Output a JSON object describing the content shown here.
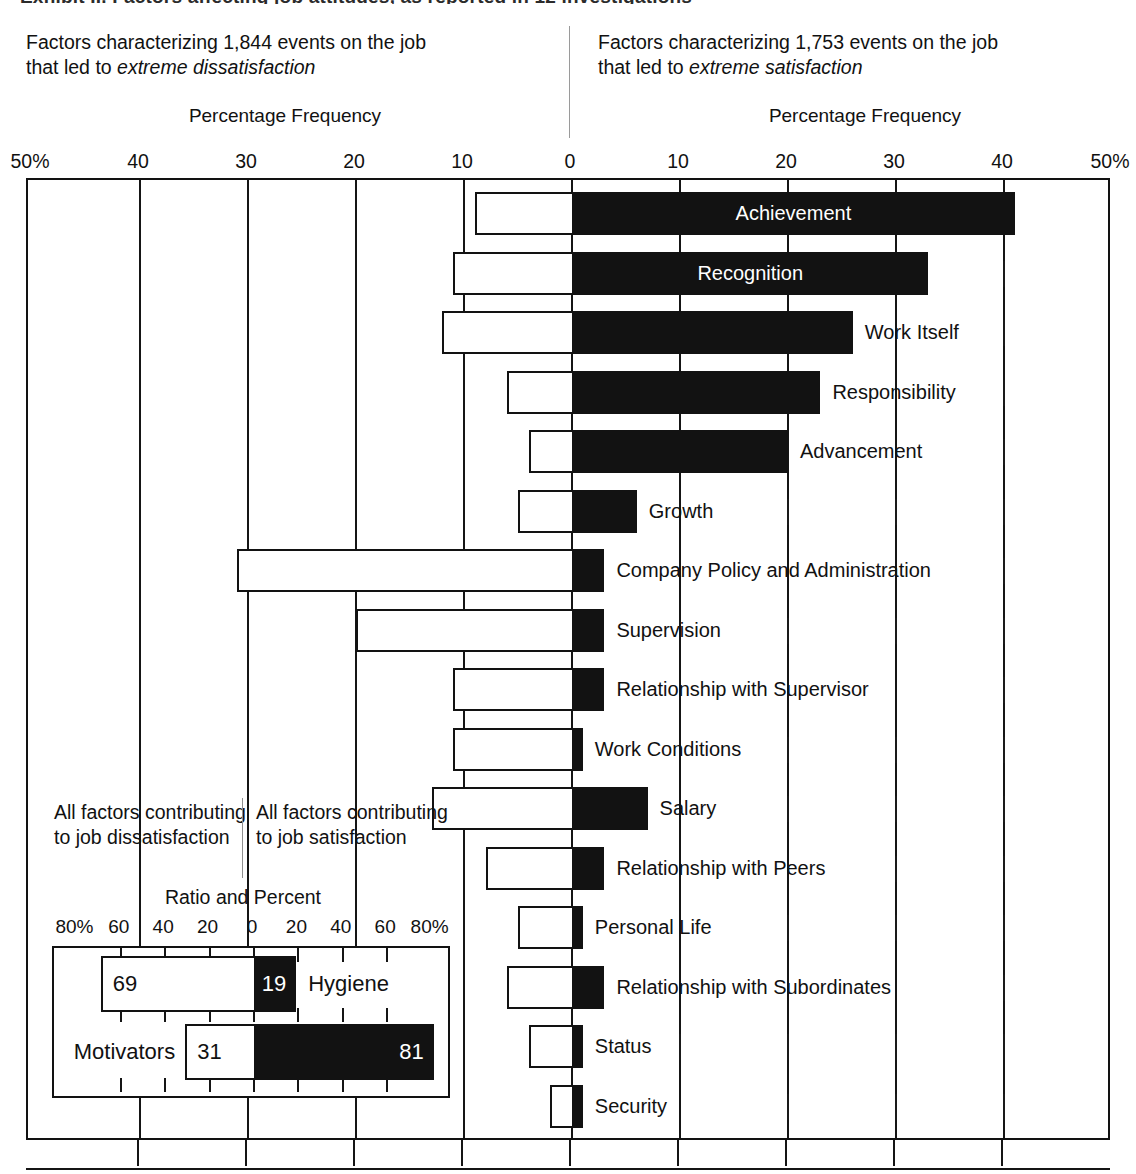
{
  "title_sliver": "Exhibit II. Factors affecting job attitudes, as reported in 12 investigations",
  "captions": {
    "left_pre": "Factors characterizing 1,844 events on the job that led to ",
    "left_em": "extreme dissatisfaction",
    "right_pre": "Factors characterizing 1,753 events on the job that led to ",
    "right_em": "extreme satisfaction",
    "axis_title_left": "Percentage Frequency",
    "axis_title_right": "Percentage Frequency"
  },
  "axis": {
    "ticks": [
      "50%",
      "40",
      "30",
      "20",
      "10",
      "0",
      "10",
      "20",
      "30",
      "40",
      "50%"
    ],
    "tick_values": [
      -50,
      -40,
      -30,
      -20,
      -10,
      0,
      10,
      20,
      30,
      40,
      50
    ],
    "min": -50,
    "max": 50
  },
  "legend": {
    "black_meaning": "extreme satisfaction (motivators)",
    "white_meaning": "extreme dissatisfaction (hygiene)"
  },
  "chart_data": {
    "type": "bar",
    "title": "Factors affecting job attitudes",
    "xlabel": "Percentage Frequency",
    "ylabel": "",
    "xlim": [
      -50,
      50
    ],
    "grid": true,
    "legend_position": "none",
    "orientation": "horizontal-diverging",
    "categories": [
      "Achievement",
      "Recognition",
      "Work Itself",
      "Responsibility",
      "Advancement",
      "Growth",
      "Company Policy and Administration",
      "Supervision",
      "Relationship with Supervisor",
      "Work Conditions",
      "Salary",
      "Relationship with Peers",
      "Personal Life",
      "Relationship with Subordinates",
      "Status",
      "Security"
    ],
    "series": [
      {
        "name": "Factors leading to extreme satisfaction",
        "color": "#121212",
        "values": [
          41,
          33,
          26,
          23,
          20,
          6,
          3,
          3,
          3,
          1,
          7,
          3,
          1,
          3,
          1,
          1
        ]
      },
      {
        "name": "Factors leading to extreme dissatisfaction",
        "color": "#ffffff",
        "values": [
          9,
          11,
          12,
          6,
          4,
          5,
          31,
          20,
          11,
          11,
          13,
          8,
          5,
          6,
          4,
          2
        ]
      }
    ],
    "rows": [
      {
        "label": "Achievement",
        "satisfaction": 41,
        "dissatisfaction": 9,
        "label_position": "inside"
      },
      {
        "label": "Recognition",
        "satisfaction": 33,
        "dissatisfaction": 11,
        "label_position": "inside"
      },
      {
        "label": "Work Itself",
        "satisfaction": 26,
        "dissatisfaction": 12,
        "label_position": "outside"
      },
      {
        "label": "Responsibility",
        "satisfaction": 23,
        "dissatisfaction": 6,
        "label_position": "outside"
      },
      {
        "label": "Advancement",
        "satisfaction": 20,
        "dissatisfaction": 4,
        "label_position": "outside"
      },
      {
        "label": "Growth",
        "satisfaction": 6,
        "dissatisfaction": 5,
        "label_position": "outside"
      },
      {
        "label": "Company Policy and Administration",
        "satisfaction": 3,
        "dissatisfaction": 31,
        "label_position": "outside"
      },
      {
        "label": "Supervision",
        "satisfaction": 3,
        "dissatisfaction": 20,
        "label_position": "outside"
      },
      {
        "label": "Relationship with Supervisor",
        "satisfaction": 3,
        "dissatisfaction": 11,
        "label_position": "outside"
      },
      {
        "label": "Work Conditions",
        "satisfaction": 1,
        "dissatisfaction": 11,
        "label_position": "outside"
      },
      {
        "label": "Salary",
        "satisfaction": 7,
        "dissatisfaction": 13,
        "label_position": "outside"
      },
      {
        "label": "Relationship with Peers",
        "satisfaction": 3,
        "dissatisfaction": 8,
        "label_position": "outside"
      },
      {
        "label": "Personal Life",
        "satisfaction": 1,
        "dissatisfaction": 5,
        "label_position": "outside"
      },
      {
        "label": "Relationship with Subordinates",
        "satisfaction": 3,
        "dissatisfaction": 6,
        "label_position": "outside"
      },
      {
        "label": "Status",
        "satisfaction": 1,
        "dissatisfaction": 4,
        "label_position": "outside"
      },
      {
        "label": "Security",
        "satisfaction": 1,
        "dissatisfaction": 2,
        "label_position": "outside"
      }
    ]
  },
  "inset": {
    "left_text": "All factors contributing to job dissatisfaction",
    "right_text": "All factors contributing to job satisfaction",
    "axis_title": "Ratio and Percent",
    "ticks": [
      "80%",
      "60",
      "40",
      "20",
      "0",
      "20",
      "40",
      "60",
      "80%"
    ],
    "tick_values": [
      -80,
      -60,
      -40,
      -20,
      0,
      20,
      40,
      60,
      80
    ],
    "chart_data": {
      "type": "bar",
      "title": "Ratio and Percent",
      "xlim": [
        -80,
        80
      ],
      "orientation": "horizontal-diverging",
      "categories": [
        "Hygiene",
        "Motivators"
      ],
      "rows": [
        {
          "label": "Hygiene",
          "dissatisfaction": 69,
          "satisfaction": 19,
          "label_side": "right",
          "dis_text": "69",
          "sat_text": "19"
        },
        {
          "label": "Motivators",
          "dissatisfaction": 31,
          "satisfaction": 81,
          "label_side": "left",
          "dis_text": "31",
          "sat_text": "81"
        }
      ]
    }
  },
  "colors": {
    "black_bar": "#121212",
    "white_bar": "#ffffff",
    "frame": "#121212",
    "text": "#111111"
  }
}
